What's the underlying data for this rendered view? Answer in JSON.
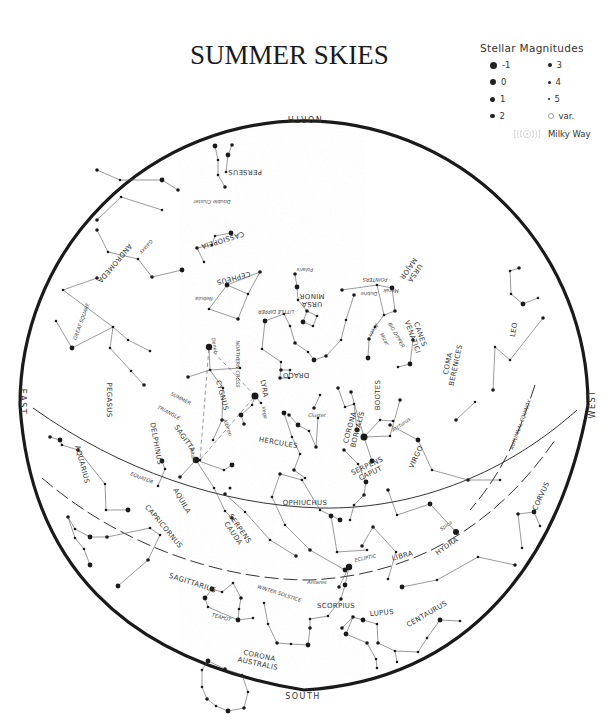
{
  "title": "SUMMER SKIES",
  "legend": {
    "title": "Stellar Magnitudes",
    "items": [
      {
        "label": "-1",
        "size": 7
      },
      {
        "label": "3",
        "size": 4
      },
      {
        "label": "0",
        "size": 6
      },
      {
        "label": "4",
        "size": 3
      },
      {
        "label": "1",
        "size": 5
      },
      {
        "label": "5",
        "size": 2
      },
      {
        "label": "2",
        "size": 4.5
      },
      {
        "label": "var.",
        "size": 4,
        "variable": true
      }
    ],
    "milky_way": "Milky Way"
  },
  "directions": {
    "north": "NORTH",
    "south": "SOUTH",
    "east": "EAST",
    "west": "WEST"
  },
  "circles": {
    "equator": "EQUATOR",
    "ecliptic": "ECLIPTIC",
    "autumnal_equinox": "AUTUMNAL EQUINOX",
    "winter_solstice": "WINTER SOLSTICE"
  },
  "constellations": [
    {
      "name": "PERSEUS",
      "x": 245,
      "y": 170,
      "rot": 180
    },
    {
      "name": "CASSIOPEIA",
      "x": 222,
      "y": 238,
      "rot": 163
    },
    {
      "name": "ANDROMEDA",
      "x": 113,
      "y": 262,
      "rot": 130
    },
    {
      "name": "CEPHEUS",
      "x": 233,
      "y": 276,
      "rot": 165
    },
    {
      "name": "URSA MINOR",
      "x": 312,
      "y": 302,
      "rot": 180
    },
    {
      "name": "URSA MAJOR",
      "x": 413,
      "y": 272,
      "rot": 125
    },
    {
      "name": "CANES VENATICI",
      "x": 418,
      "y": 335,
      "rot": 70
    },
    {
      "name": "COMA BERENICES",
      "x": 450,
      "y": 364,
      "rot": -78
    },
    {
      "name": "LEO",
      "x": 516,
      "y": 330,
      "rot": -80
    },
    {
      "name": "DRACO",
      "x": 296,
      "y": 373,
      "rot": 180
    },
    {
      "name": "PEGASUS",
      "x": 107,
      "y": 400,
      "rot": 90
    },
    {
      "name": "CYGNUS",
      "x": 220,
      "y": 396,
      "rot": 75
    },
    {
      "name": "LYRA",
      "x": 262,
      "y": 389,
      "rot": 80
    },
    {
      "name": "BOOTES",
      "x": 380,
      "y": 395,
      "rot": -90
    },
    {
      "name": "HERCULES",
      "x": 278,
      "y": 445,
      "rot": 10
    },
    {
      "name": "CORONA BOREALIS",
      "x": 352,
      "y": 428,
      "rot": -75
    },
    {
      "name": "DELPHINUS",
      "x": 154,
      "y": 444,
      "rot": 80
    },
    {
      "name": "SAGITTA",
      "x": 183,
      "y": 440,
      "rot": 55
    },
    {
      "name": "VIRGO",
      "x": 418,
      "y": 458,
      "rot": -65
    },
    {
      "name": "SERPENS CAPUT",
      "x": 368,
      "y": 468,
      "rot": -25
    },
    {
      "name": "AQUARIUS",
      "x": 80,
      "y": 465,
      "rot": 75
    },
    {
      "name": "OPHIUCHUS",
      "x": 305,
      "y": 505,
      "rot": 0
    },
    {
      "name": "AQUILA",
      "x": 180,
      "y": 502,
      "rot": 60
    },
    {
      "name": "CAPRICORNUS",
      "x": 162,
      "y": 528,
      "rot": 50
    },
    {
      "name": "SERPENS CAUDA",
      "x": 238,
      "y": 530,
      "rot": 55
    },
    {
      "name": "CORVUS",
      "x": 543,
      "y": 497,
      "rot": -65
    },
    {
      "name": "HYDRA",
      "x": 448,
      "y": 548,
      "rot": -35
    },
    {
      "name": "LIBRA",
      "x": 403,
      "y": 558,
      "rot": -15
    },
    {
      "name": "SAGITTARIUS",
      "x": 192,
      "y": 585,
      "rot": 18
    },
    {
      "name": "SCORPIUS",
      "x": 336,
      "y": 608,
      "rot": 0
    },
    {
      "name": "LUPUS",
      "x": 382,
      "y": 615,
      "rot": -5
    },
    {
      "name": "CENTAURUS",
      "x": 428,
      "y": 616,
      "rot": -30
    },
    {
      "name": "CORONA AUSTRALIS",
      "x": 259,
      "y": 658,
      "rot": 12
    }
  ],
  "special_labels": [
    {
      "text": "SUMMER",
      "x": 180,
      "y": 400,
      "rot": 28
    },
    {
      "text": "TRIANGLE",
      "x": 168,
      "y": 414,
      "rot": 28
    },
    {
      "text": "NORTHERN CROSS",
      "x": 236,
      "y": 364,
      "rot": 90
    },
    {
      "text": "GREAT SQUARE",
      "x": 83,
      "y": 322,
      "rot": -70
    },
    {
      "text": "LITTLE DIPPER",
      "x": 276,
      "y": 310,
      "rot": 180
    },
    {
      "text": "BIG DIPPER",
      "x": 395,
      "y": 336,
      "rot": 60
    },
    {
      "text": "POINTERS",
      "x": 375,
      "y": 278,
      "rot": 180
    },
    {
      "text": "TEAPOT",
      "x": 221,
      "y": 619,
      "rot": 15
    },
    {
      "text": "Double Cluster",
      "x": 212,
      "y": 200,
      "rot": 180
    },
    {
      "text": "Galaxy",
      "x": 145,
      "y": 246,
      "rot": 130
    },
    {
      "text": "Nebula",
      "x": 204,
      "y": 297,
      "rot": 180
    }
  ],
  "star_labels": [
    {
      "text": "Polaris",
      "x": 305,
      "y": 268,
      "rot": 180
    },
    {
      "text": "Merak",
      "x": 391,
      "y": 289,
      "rot": 180
    },
    {
      "text": "Dubhe",
      "x": 369,
      "y": 292,
      "rot": 180
    },
    {
      "text": "Alioth",
      "x": 372,
      "y": 329,
      "rot": 120
    },
    {
      "text": "Mizar",
      "x": 383,
      "y": 340,
      "rot": 60
    },
    {
      "text": "Deneb",
      "x": 213,
      "y": 346,
      "rot": 80
    },
    {
      "text": "Vega",
      "x": 263,
      "y": 413,
      "rot": 80
    },
    {
      "text": "Albireo",
      "x": 226,
      "y": 428,
      "rot": 70
    },
    {
      "text": "Altair",
      "x": 191,
      "y": 455,
      "rot": 80
    },
    {
      "text": "Arcturus",
      "x": 402,
      "y": 426,
      "rot": -35
    },
    {
      "text": "Cluster",
      "x": 317,
      "y": 417,
      "rot": 0
    },
    {
      "text": "Spica",
      "x": 447,
      "y": 527,
      "rot": -35
    },
    {
      "text": "Antares",
      "x": 317,
      "y": 584,
      "rot": 0
    }
  ]
}
